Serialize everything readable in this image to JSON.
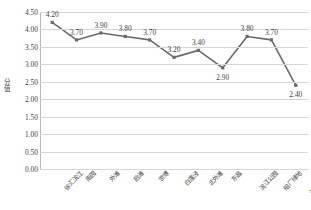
{
  "chart_data": {
    "type": "line",
    "title": "",
    "xlabel": "",
    "ylabel": "分值",
    "ylim": [
      0.0,
      4.5
    ],
    "grid": true,
    "legend": false,
    "line_color": "#6b6b6b",
    "marker": "square",
    "categories": [
      "徐汇滨江",
      "南园",
      "外滩",
      "后滩",
      "世博",
      "白莲泾",
      "北外滩",
      "东昌",
      "滨江公园",
      "船厂绿地",
      "滨海新片区"
    ],
    "values": [
      4.2,
      3.7,
      3.9,
      3.8,
      3.7,
      3.2,
      3.4,
      2.9,
      3.8,
      3.7,
      2.4
    ],
    "point_labels": [
      "4.20",
      "3.70",
      "3.90",
      "3.80",
      "3.70",
      "3.20",
      "3.40",
      "2.90",
      "3.80",
      "3.70",
      "2.40"
    ],
    "yticks": [
      "4.50",
      "4.00",
      "3.50",
      "3.00",
      "2.50",
      "2.00",
      "1.50",
      "1.00",
      "0.50",
      "0.00"
    ],
    "ytick_values": [
      4.5,
      4.0,
      3.5,
      3.0,
      2.5,
      2.0,
      1.5,
      1.0,
      0.5,
      0.0
    ]
  }
}
